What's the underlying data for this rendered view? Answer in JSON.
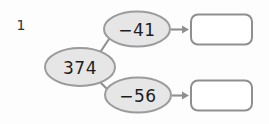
{
  "page": {
    "background_color": "#fdfdfd",
    "item_number": "1"
  },
  "palette": {
    "node_fill": "#e6e6e6",
    "node_stroke": "#9b9b9b",
    "connector_stroke": "#8f8f8f",
    "arrow_stroke": "#8f8f8f",
    "box_stroke": "#8f8f8f",
    "box_fill": "#ffffff",
    "text_color": "#1d1d1d"
  },
  "diagram": {
    "type": "function-machine-flow",
    "start_node": {
      "label": "374",
      "shape": "ellipse"
    },
    "branches": [
      {
        "operation_node": {
          "label": "−41",
          "shape": "ellipse"
        },
        "arrow": {
          "direction": "right",
          "glyph": "arrow-right-icon"
        },
        "answer_box": {
          "value": "",
          "placeholder": "",
          "shape": "rounded-rect",
          "editable": true
        }
      },
      {
        "operation_node": {
          "label": "−56",
          "shape": "ellipse"
        },
        "arrow": {
          "direction": "right",
          "glyph": "arrow-right-icon"
        },
        "answer_box": {
          "value": "",
          "placeholder": "",
          "shape": "rounded-rect",
          "editable": true
        }
      }
    ]
  }
}
